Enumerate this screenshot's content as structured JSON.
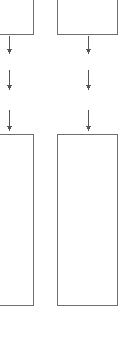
{
  "canvas": {
    "width": 121,
    "height": 342,
    "background": "#ffffff",
    "description": "Cropped flowchart fragment: two columns of process boxes connected by downward arrows"
  },
  "style": {
    "box_stroke": "#6f6f6f",
    "box_fill": "#ffffff",
    "box_stroke_width": 1,
    "arrow_color": "#555555",
    "arrow_stroke_width": 1.4
  },
  "nodes": [
    {
      "id": "top-left-box",
      "name": "top-left-process-box",
      "label": "",
      "x": -12,
      "y": -14,
      "width": 45,
      "height": 48,
      "clipped": "left-and-top"
    },
    {
      "id": "top-right-box",
      "name": "top-right-process-box",
      "label": "",
      "x": 57,
      "y": -14,
      "width": 60,
      "height": 48,
      "clipped": "top"
    },
    {
      "id": "bottom-left-box",
      "name": "bottom-left-process-box",
      "label": "",
      "x": -12,
      "y": 134,
      "width": 45,
      "height": 171,
      "clipped": "left"
    },
    {
      "id": "bottom-right-box",
      "name": "bottom-right-process-box",
      "label": "",
      "x": 57,
      "y": 134,
      "width": 60,
      "height": 171,
      "clipped": "none"
    }
  ],
  "connectors": [
    {
      "id": "left-arrow-1",
      "name": "left-column-arrow-1",
      "x": 9,
      "y1": 36,
      "y2": 54,
      "direction": "down"
    },
    {
      "id": "left-arrow-2",
      "name": "left-column-arrow-2",
      "x": 9,
      "y1": 70,
      "y2": 90,
      "direction": "down"
    },
    {
      "id": "left-arrow-3",
      "name": "left-column-arrow-3",
      "x": 9,
      "y1": 110,
      "y2": 131,
      "direction": "down"
    },
    {
      "id": "right-arrow-1",
      "name": "right-column-arrow-1",
      "x": 88,
      "y1": 36,
      "y2": 54,
      "direction": "down"
    },
    {
      "id": "right-arrow-2",
      "name": "right-column-arrow-2",
      "x": 88,
      "y1": 70,
      "y2": 90,
      "direction": "down"
    },
    {
      "id": "right-arrow-3",
      "name": "right-column-arrow-3",
      "x": 88,
      "y1": 110,
      "y2": 131,
      "direction": "down"
    }
  ]
}
